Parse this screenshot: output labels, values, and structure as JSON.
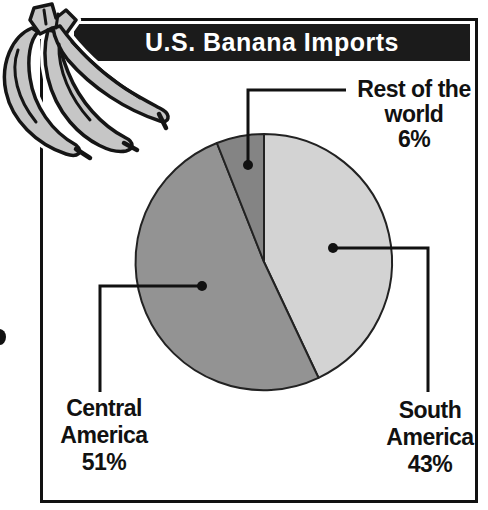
{
  "header": {
    "title": "U.S. Banana Imports"
  },
  "colors": {
    "title_bar_bg": "#1b1b1b",
    "title_text": "#ffffff",
    "frame_border": "#111111",
    "pie_outline": "#222222",
    "leader": "#111111",
    "banana_fill": "#c6c6c6",
    "banana_outline": "#151515"
  },
  "chart_data": {
    "type": "pie",
    "title": "U.S. Banana Imports",
    "start_angle": "12-oclock",
    "direction": "clockwise",
    "legend_position": "none",
    "slices": [
      {
        "label": "South America",
        "value_pct": 43,
        "color": "#d3d3d3",
        "label_lines": [
          "South",
          "America",
          "43%"
        ]
      },
      {
        "label": "Central America",
        "value_pct": 51,
        "color": "#939393",
        "label_lines": [
          "Central",
          "America",
          "51%"
        ]
      },
      {
        "label": "Rest of the world",
        "value_pct": 6,
        "color": "#848484",
        "label_lines": [
          "Rest of the",
          "world",
          "6%"
        ]
      }
    ]
  },
  "decor": {
    "illustration": "banana-bunch-icon"
  }
}
